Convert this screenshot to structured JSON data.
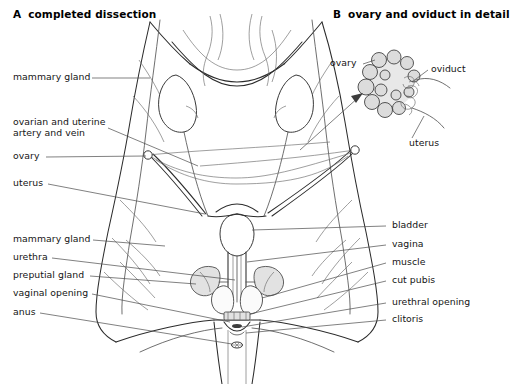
{
  "figure": {
    "background": "#ffffff",
    "ink": "#2b2b2b",
    "leader_color": "#4a4a4a",
    "panels": [
      {
        "id": "A",
        "letter": "A",
        "title": "completed dissection"
      },
      {
        "id": "B",
        "letter": "B",
        "title": "ovary and oviduct in detail"
      }
    ]
  },
  "panel_a": {
    "labels_left": [
      {
        "name": "mammary-gland-upper",
        "text": "mammary gland"
      },
      {
        "name": "ovarian-uterine-artery-vein",
        "text_line1": "ovarian and uterine",
        "text_line2": "artery and vein"
      },
      {
        "name": "ovary",
        "text": "ovary"
      },
      {
        "name": "uterus",
        "text": "uterus"
      },
      {
        "name": "mammary-gland-lower",
        "text": "mammary gland"
      },
      {
        "name": "urethra",
        "text": "urethra"
      },
      {
        "name": "preputial-gland",
        "text": "preputial gland"
      },
      {
        "name": "vaginal-opening",
        "text": "vaginal opening"
      },
      {
        "name": "anus",
        "text": "anus"
      }
    ],
    "labels_right": [
      {
        "name": "bladder",
        "text": "bladder"
      },
      {
        "name": "vagina",
        "text": "vagina"
      },
      {
        "name": "muscle",
        "text": "muscle"
      },
      {
        "name": "cut-pubis",
        "text": "cut pubis"
      },
      {
        "name": "urethral-opening",
        "text": "urethral opening"
      },
      {
        "name": "clitoris",
        "text": "clitoris"
      }
    ]
  },
  "panel_b": {
    "labels": [
      {
        "name": "ovary-detail",
        "text": "ovary"
      },
      {
        "name": "oviduct-detail",
        "text": "oviduct"
      },
      {
        "name": "uterus-detail",
        "text": "uterus"
      }
    ]
  }
}
